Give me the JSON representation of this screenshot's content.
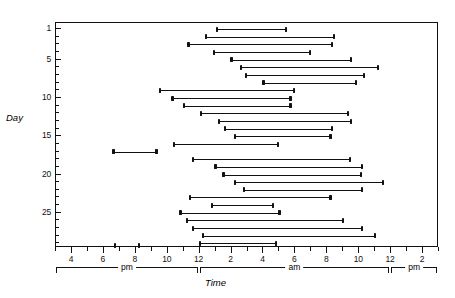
{
  "chart_data": {
    "type": "bar",
    "title": "",
    "subtitle": "",
    "xlabel": "Time",
    "ylabel": "Day",
    "grid": false,
    "legend": null,
    "orientation": "horizontal-interval",
    "x_axis": {
      "unit": "hour-of-day",
      "range_start_label": "3 pm",
      "range_end_label": "3 pm (next day)",
      "numeric_range": [
        15,
        39
      ],
      "tick_interval_hours": 1,
      "labeled_tick_interval_hours": 2,
      "tick_labels": [
        "4",
        "6",
        "8",
        "10",
        "12",
        "2",
        "4",
        "6",
        "8",
        "10",
        "12",
        "2"
      ],
      "tick_label_values": [
        16,
        18,
        20,
        22,
        24,
        26,
        28,
        30,
        32,
        34,
        36,
        38
      ],
      "period_brackets": [
        {
          "label": "pm",
          "start": 15,
          "end": 24
        },
        {
          "label": "am",
          "start": 24,
          "end": 36
        },
        {
          "label": "pm",
          "start": 36,
          "end": 39
        }
      ]
    },
    "y_axis": {
      "unit": "day",
      "range": [
        0.2,
        29.6
      ],
      "tick_interval_days": 1,
      "tick_labels": [
        "1",
        "5",
        "10",
        "15",
        "20",
        "25"
      ],
      "tick_label_values": [
        1,
        5,
        10,
        15,
        20,
        25
      ],
      "direction": "top-to-bottom"
    },
    "categories": [
      1,
      2,
      3,
      4,
      5,
      6,
      7,
      8,
      9,
      10,
      11,
      12,
      13,
      14,
      15,
      16,
      17,
      18,
      19,
      20,
      21,
      22,
      23,
      24,
      25,
      26,
      27,
      28,
      29
    ],
    "intervals": [
      {
        "day": 1,
        "start": 25.1,
        "end": 29.4
      },
      {
        "day": 2,
        "start": 24.4,
        "end": 32.4
      },
      {
        "day": 3,
        "start": 23.3,
        "end": 32.3
      },
      {
        "day": 4,
        "start": 24.9,
        "end": 30.9
      },
      {
        "day": 5,
        "start": 26.0,
        "end": 33.5
      },
      {
        "day": 6,
        "start": 26.6,
        "end": 35.2
      },
      {
        "day": 7,
        "start": 26.9,
        "end": 34.3
      },
      {
        "day": 8,
        "start": 28.0,
        "end": 33.8
      },
      {
        "day": 9,
        "start": 21.5,
        "end": 29.9
      },
      {
        "day": 10,
        "start": 22.3,
        "end": 29.7
      },
      {
        "day": 11,
        "start": 23.0,
        "end": 29.7
      },
      {
        "day": 12,
        "start": 24.1,
        "end": 33.3
      },
      {
        "day": 13,
        "start": 25.2,
        "end": 33.5
      },
      {
        "day": 14,
        "start": 25.6,
        "end": 32.3
      },
      {
        "day": 15,
        "start": 26.2,
        "end": 32.2
      },
      {
        "day": 16,
        "start": 22.4,
        "end": 28.9
      },
      {
        "day": 17,
        "start": 18.6,
        "end": 21.3
      },
      {
        "day": 18,
        "start": 23.6,
        "end": 33.4
      },
      {
        "day": 19,
        "start": 25.0,
        "end": 34.2
      },
      {
        "day": 20,
        "start": 25.5,
        "end": 34.1
      },
      {
        "day": 21,
        "start": 26.2,
        "end": 35.5
      },
      {
        "day": 22,
        "start": 26.8,
        "end": 34.2
      },
      {
        "day": 23,
        "start": 23.4,
        "end": 32.2
      },
      {
        "day": 24,
        "start": 24.8,
        "end": 28.6
      },
      {
        "day": 25,
        "start": 22.8,
        "end": 29.0
      },
      {
        "day": 26,
        "start": 23.2,
        "end": 33.0
      },
      {
        "day": 27,
        "start": 23.6,
        "end": 34.2
      },
      {
        "day": 28,
        "start": 24.2,
        "end": 35.0
      },
      {
        "day": 29,
        "start": 24.0,
        "end": 28.8
      }
    ],
    "extra_intervals": [
      {
        "day": 29.3,
        "start": 18.7,
        "end": 20.2
      }
    ]
  }
}
